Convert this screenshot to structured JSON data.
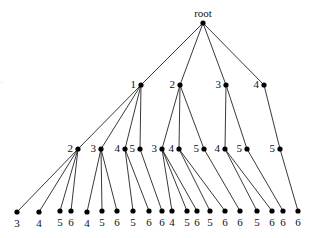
{
  "diagram": {
    "type": "tree",
    "root_label": "root",
    "nodes": [
      {
        "id": "r",
        "label": "root",
        "x": 203,
        "y": 23,
        "label_pos": "top"
      },
      {
        "id": "a1",
        "label": "1",
        "x": 141,
        "y": 85,
        "parent": "r"
      },
      {
        "id": "a2",
        "label": "2",
        "x": 180,
        "y": 85,
        "parent": "r"
      },
      {
        "id": "a3",
        "label": "3",
        "x": 226,
        "y": 85,
        "parent": "r"
      },
      {
        "id": "a4",
        "label": "4",
        "x": 264,
        "y": 85,
        "parent": "r"
      },
      {
        "id": "b1",
        "label": "2",
        "x": 78,
        "y": 149,
        "parent": "a1"
      },
      {
        "id": "b2",
        "label": "3",
        "x": 101,
        "y": 149,
        "parent": "a1"
      },
      {
        "id": "b3",
        "label": "4",
        "x": 125,
        "y": 149,
        "parent": "a1"
      },
      {
        "id": "b4",
        "label": "5",
        "x": 140,
        "y": 149,
        "parent": "a1"
      },
      {
        "id": "b5",
        "label": "3",
        "x": 162,
        "y": 149,
        "parent": "a2"
      },
      {
        "id": "b6",
        "label": "4",
        "x": 179,
        "y": 149,
        "parent": "a2"
      },
      {
        "id": "b7",
        "label": "5",
        "x": 204,
        "y": 149,
        "parent": "a2"
      },
      {
        "id": "b8",
        "label": "4",
        "x": 225,
        "y": 149,
        "parent": "a3"
      },
      {
        "id": "b9",
        "label": "5",
        "x": 247,
        "y": 149,
        "parent": "a3"
      },
      {
        "id": "b10",
        "label": "5",
        "x": 280,
        "y": 149,
        "parent": "a4"
      },
      {
        "id": "c1",
        "label": "3",
        "x": 17,
        "y": 212,
        "parent": "b1"
      },
      {
        "id": "c2",
        "label": "4",
        "x": 39,
        "y": 212,
        "parent": "b1"
      },
      {
        "id": "c3",
        "label": "5",
        "x": 60,
        "y": 211,
        "parent": "b1"
      },
      {
        "id": "c4",
        "label": "6",
        "x": 71,
        "y": 211,
        "parent": "b1"
      },
      {
        "id": "c5",
        "label": "4",
        "x": 87,
        "y": 212,
        "parent": "b2"
      },
      {
        "id": "c6",
        "label": "5",
        "x": 102,
        "y": 211,
        "parent": "b2"
      },
      {
        "id": "c7",
        "label": "6",
        "x": 117,
        "y": 211,
        "parent": "b2"
      },
      {
        "id": "c8",
        "label": "5",
        "x": 133,
        "y": 211,
        "parent": "b3"
      },
      {
        "id": "c9",
        "label": "6",
        "x": 149,
        "y": 211,
        "parent": "b3"
      },
      {
        "id": "c10",
        "label": "6",
        "x": 162,
        "y": 211,
        "parent": "b4"
      },
      {
        "id": "c11",
        "label": "4",
        "x": 172,
        "y": 211,
        "parent": "b5"
      },
      {
        "id": "c12",
        "label": "5",
        "x": 187,
        "y": 211,
        "parent": "b5"
      },
      {
        "id": "c13",
        "label": "6",
        "x": 197,
        "y": 211,
        "parent": "b5"
      },
      {
        "id": "c14",
        "label": "5",
        "x": 210,
        "y": 211,
        "parent": "b6"
      },
      {
        "id": "c15",
        "label": "6",
        "x": 225,
        "y": 211,
        "parent": "b6"
      },
      {
        "id": "c16",
        "label": "6",
        "x": 240,
        "y": 211,
        "parent": "b7"
      },
      {
        "id": "c17",
        "label": "5",
        "x": 257,
        "y": 211,
        "parent": "b8"
      },
      {
        "id": "c18",
        "label": "6",
        "x": 272,
        "y": 211,
        "parent": "b8"
      },
      {
        "id": "c19",
        "label": "6",
        "x": 283,
        "y": 211,
        "parent": "b9"
      },
      {
        "id": "c20",
        "label": "6",
        "x": 298,
        "y": 211,
        "parent": "b10"
      }
    ],
    "colors": {
      "edge": "#222222",
      "node": "#000000",
      "text": "#111111",
      "background": "#ffffff"
    }
  },
  "artifact_text": "·"
}
